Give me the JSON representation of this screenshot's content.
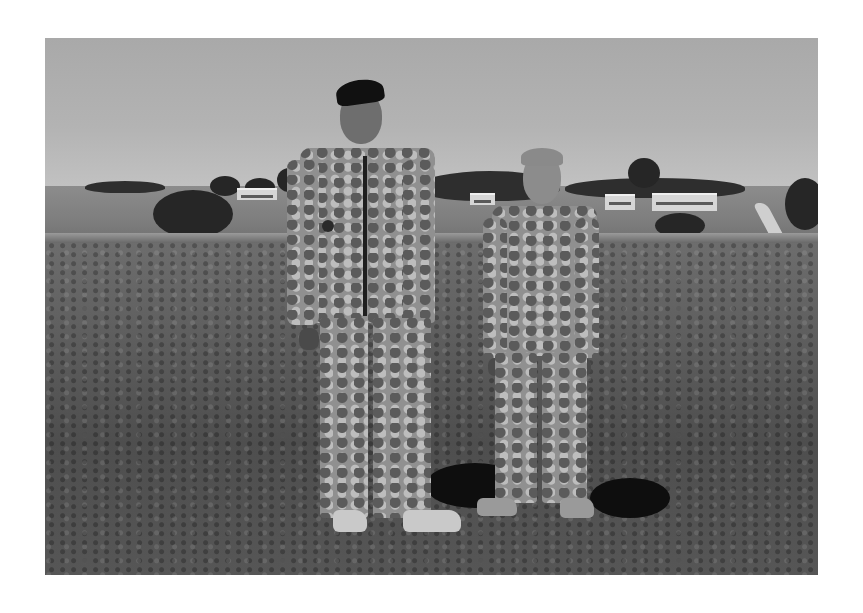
{
  "image": {
    "type": "photograph",
    "mode": "black-and-white",
    "border": "white",
    "subject": "Two people in camouflage military uniforms standing on a grassy field",
    "figures": [
      {
        "name": "adult-soldier",
        "description": "Adult man in camouflage uniform wearing a dark beret, tan combat boots",
        "position": "left-center"
      },
      {
        "name": "child",
        "description": "Young boy with short light hair in camouflage uniform and sneakers",
        "position": "right-center"
      }
    ],
    "background": {
      "sky": "clear, overcast-grey tone",
      "midground": "rolling grassy hills, trees, long low buildings, a winding road on the right",
      "foreground": "grass field with clover and wildflowers, shadows cast behind figures"
    }
  }
}
